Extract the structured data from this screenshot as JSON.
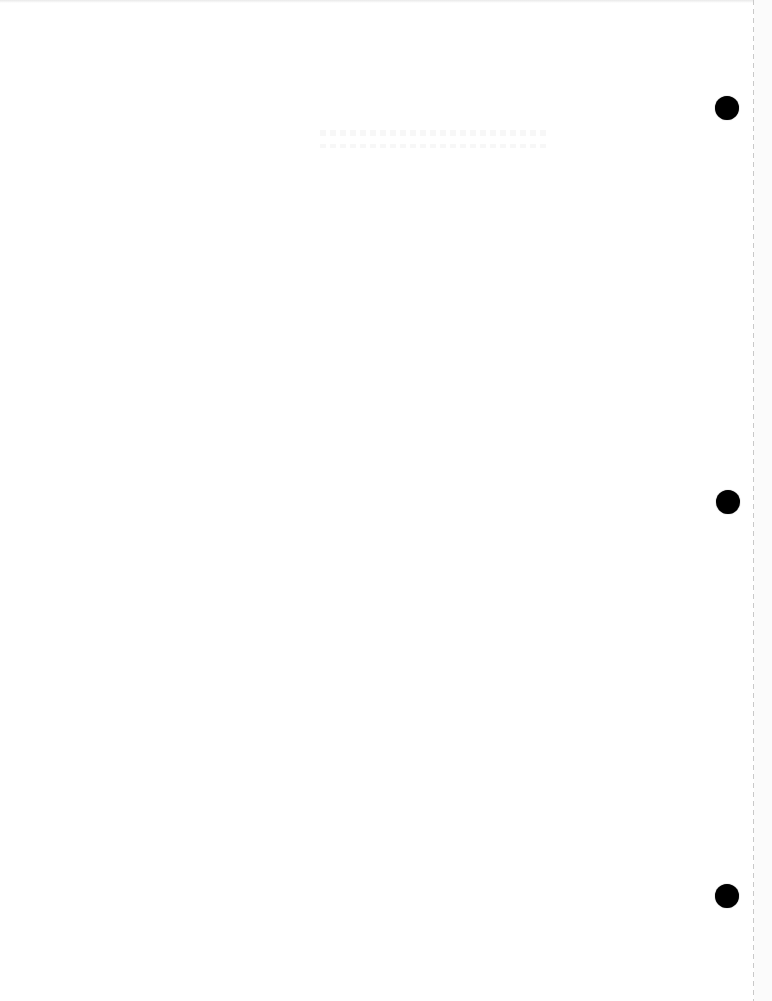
{
  "page": {
    "type": "blank-punched-sheet",
    "background_color": "#ffffff",
    "hole_color": "#000000",
    "perforation_color": "#c9c9c9",
    "holes": [
      {
        "name": "top-hole",
        "cx": 727,
        "cy": 108,
        "diameter": 24
      },
      {
        "name": "middle-hole",
        "cx": 728,
        "cy": 502,
        "diameter": 24
      },
      {
        "name": "bottom-hole",
        "cx": 727,
        "cy": 896,
        "diameter": 24
      }
    ],
    "perforation_x": 753
  }
}
